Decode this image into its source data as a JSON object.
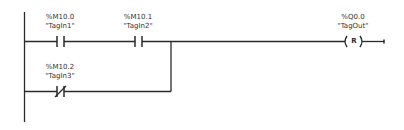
{
  "network": {
    "colors": {
      "line": "#2a2a2a",
      "text": "#333333",
      "background": "#ffffff"
    },
    "contacts": [
      {
        "id": "c1",
        "type": "normally-open",
        "address": "%M10.0",
        "tag": "\"TagIn1\"",
        "branch": "main"
      },
      {
        "id": "c2",
        "type": "normally-open",
        "address": "%M10.1",
        "tag": "\"TagIn2\"",
        "branch": "main"
      },
      {
        "id": "c3",
        "type": "normally-closed",
        "address": "%M10.2",
        "tag": "\"TagIn3\"",
        "branch": "parallel"
      }
    ],
    "coil": {
      "type": "reset",
      "symbol": "R",
      "address": "%Q0.0",
      "tag": "\"TagOut\""
    }
  }
}
